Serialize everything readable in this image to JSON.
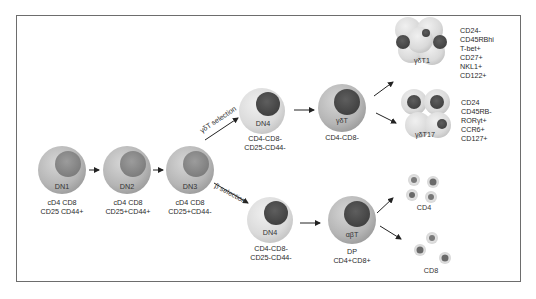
{
  "diagram": {
    "title": "",
    "stages": {
      "dn1": {
        "name": "DN1",
        "markers": [
          "cD4 CD8",
          "CD25 CD44+"
        ]
      },
      "dn2": {
        "name": "DN2",
        "markers": [
          "cD4 CD8",
          "CD25+CD44+"
        ]
      },
      "dn3": {
        "name": "DN3",
        "markers": [
          "cD4 CD8",
          "CD25+CD44-"
        ]
      },
      "dn4_gd": {
        "name": "DN4",
        "markers": [
          "CD4-CD8-",
          "CD25-CD44-"
        ]
      },
      "gdt": {
        "name": "γδT",
        "markers": [
          "CD4-CD8-"
        ]
      },
      "dn4_ab": {
        "name": "DN4",
        "markers": [
          "CD4-CD8-",
          "CD25-CD44-"
        ]
      },
      "abt": {
        "name": "αβT",
        "markers": [
          "DP",
          "CD4+CD8+"
        ]
      },
      "gdt1": {
        "name": "γδT1",
        "markers": [
          "CD24-",
          "CD45RBhi",
          "T-bet+",
          "CD27+",
          "NKL1+",
          "CD122+"
        ]
      },
      "gdt17": {
        "name": "γδT17",
        "markers": [
          "CD24",
          "CD45RB-",
          "RORγt+",
          "CCR6+",
          "CD127+"
        ]
      },
      "cd4": {
        "name": "CD4"
      },
      "cd8": {
        "name": "CD8"
      }
    },
    "selections": {
      "gd": "γδT selection",
      "beta": "β selection"
    },
    "colors": {
      "cell_outer": "#b9b9b9",
      "cell_outer_light": "#dcdcdc",
      "nucleus_early": "#8a8a8a",
      "nucleus_late": "#4f4f4f",
      "border": "#6d6d6d",
      "arrow": "#222222"
    }
  }
}
